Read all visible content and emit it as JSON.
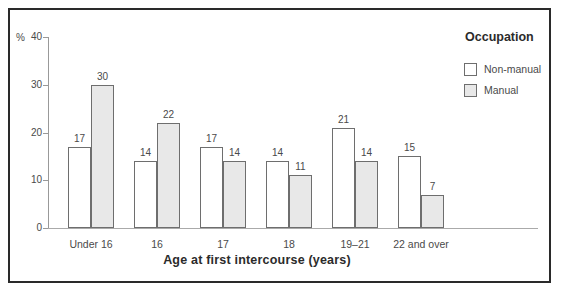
{
  "colors": {
    "frame_border": "#2a2a2a",
    "axis": "#999999",
    "bar_border": "#6e6e6e",
    "nonmanual_fill": "#ffffff",
    "manual_fill": "#e8e8e8",
    "text": "#4a4a4a"
  },
  "chart_data": {
    "type": "bar",
    "title": "",
    "legend_title": "Occupation",
    "xlabel": "Age at first intercourse (years)",
    "ylabel": "%",
    "ylim": [
      0,
      40
    ],
    "yticks": [
      0,
      10,
      20,
      30,
      40
    ],
    "grid": false,
    "legend_position": "top-right",
    "bar_value_labels": true,
    "categories": [
      "Under 16",
      "16",
      "17",
      "18",
      "19–21",
      "22 and over"
    ],
    "series": [
      {
        "name": "Non-manual",
        "values": [
          17,
          14,
          17,
          14,
          21,
          15
        ],
        "fill": "#ffffff"
      },
      {
        "name": "Manual",
        "values": [
          30,
          22,
          14,
          11,
          14,
          7
        ],
        "fill": "#e8e8e8"
      }
    ]
  }
}
